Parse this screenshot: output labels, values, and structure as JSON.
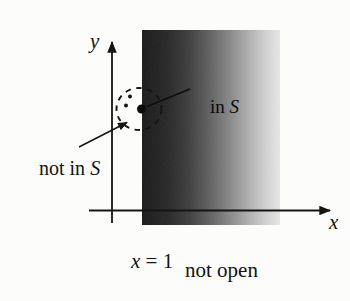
{
  "figure": {
    "caption": "not open",
    "axes": {
      "x_label": "x",
      "y_label": "y"
    },
    "boundary_equation": {
      "variable": "x",
      "rest": " = 1"
    },
    "labels": {
      "in_s": {
        "prefix": "in ",
        "set_symbol": "S"
      },
      "not_in_s": {
        "prefix": "not in ",
        "set_symbol": "S"
      }
    },
    "colors": {
      "ink": "#141414",
      "background": "#fcfcfb",
      "region_gradient_left": "#1a1a1a",
      "region_gradient_right": "#e9e9e9"
    }
  }
}
